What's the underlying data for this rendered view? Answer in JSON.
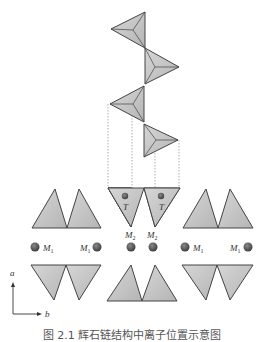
{
  "figure": {
    "type": "crystal-structure-schematic",
    "chain": {
      "description": "Helical chain of corner-sharing tetrahedra viewed along chain axis",
      "tetrahedra_count": 4
    },
    "labels": {
      "T_left": "T",
      "T_right": "T",
      "M2_left": "M",
      "M2_left_sub": "2",
      "M2_right": "M",
      "M2_right_sub": "2",
      "M1_a": "M",
      "M1_a_sub": "1",
      "M1_b": "M",
      "M1_b_sub": "1",
      "M1_c": "M",
      "M1_c_sub": "1",
      "M1_d": "M",
      "M1_d_sub": "1"
    },
    "axes": {
      "vertical": "a",
      "horizontal": "b"
    },
    "caption": "图 2.1   辉石链结构中离子位置示意图"
  },
  "colors": {
    "tetra_fill": "#c8c8c8",
    "tetra_stroke": "#444444",
    "atom_fill": "#555555",
    "dotted_line": "#999999"
  }
}
